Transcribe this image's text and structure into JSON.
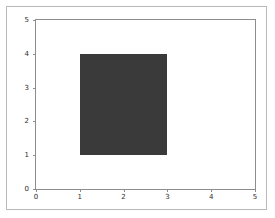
{
  "chart_data": {
    "type": "bar",
    "title": "",
    "xlabel": "",
    "ylabel": "",
    "xlim": [
      0,
      5
    ],
    "ylim": [
      0,
      5
    ],
    "grid": false,
    "legend": null,
    "xticks": [
      0,
      1,
      2,
      3,
      4,
      5
    ],
    "yticks": [
      0,
      1,
      2,
      3,
      4,
      5
    ],
    "xticklabels": [
      "0",
      "1",
      "2",
      "3",
      "4",
      "5"
    ],
    "yticklabels": [
      "0",
      "1",
      "2",
      "3",
      "4",
      "5"
    ],
    "patches": [
      {
        "name": "rectangle",
        "x": 1,
        "y": 1,
        "width": 2,
        "height": 3,
        "x_range": [
          1,
          3
        ],
        "y_range": [
          1,
          4
        ],
        "color": "#3a3a3a"
      }
    ],
    "categories": [
      "rectangle"
    ],
    "values": [
      3
    ],
    "series": [
      {
        "name": "rectangle",
        "values": [
          3
        ]
      }
    ]
  },
  "style": {
    "figure_background": "#ffffff",
    "axes_background": "#ffffff",
    "spine_color": "#8d8d8d",
    "frame_color": "#b9b9b9",
    "tick_color": "#8d8d8d",
    "ticklabel_color": "#2b2b2b",
    "patch_color": "#3a3a3a"
  }
}
